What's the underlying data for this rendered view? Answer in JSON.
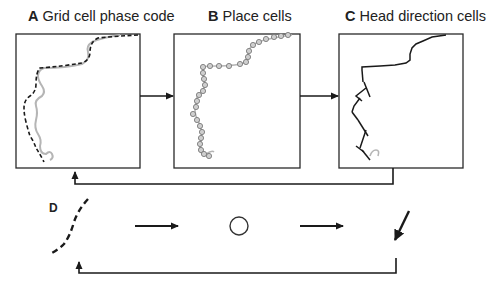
{
  "panels": {
    "a": {
      "letter": "A",
      "title": "Grid cell phase code"
    },
    "b": {
      "letter": "B",
      "title": "Place cells"
    },
    "c": {
      "letter": "C",
      "title": "Head direction cells"
    },
    "d": {
      "letter": "D"
    }
  },
  "colors": {
    "stroke": "#1a1a1a",
    "trajectory_gray": "#b5b5b5",
    "place_cell_fill": "#c8c8c8",
    "place_cell_stroke": "#7a7a7a",
    "background": "#ffffff"
  },
  "flow": {
    "top_row": [
      "Grid cell phase code",
      "Place cells",
      "Head direction cells"
    ],
    "feedback": "Head direction cells -> Grid cell phase code",
    "bottom_row_symbols": [
      "dashed-curve",
      "arrow",
      "circle",
      "arrow",
      "direction-arrow"
    ],
    "bottom_feedback": "direction-arrow -> dashed-curve"
  }
}
